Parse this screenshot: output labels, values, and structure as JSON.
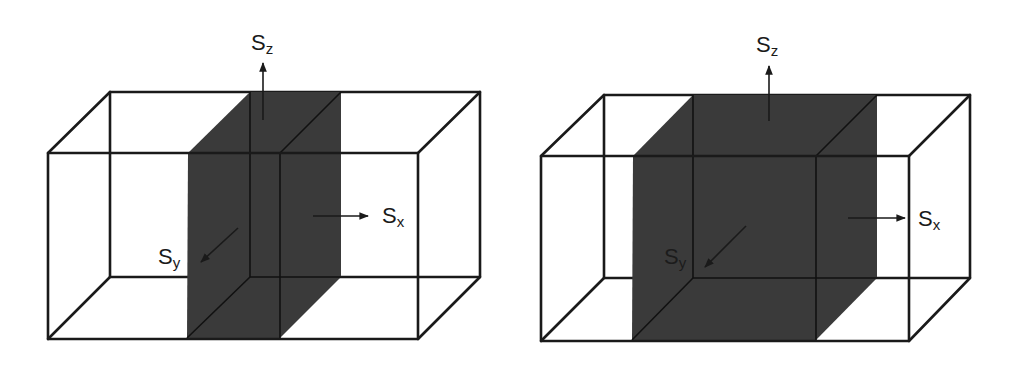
{
  "diagram": {
    "colors": {
      "edge": "#1a1a1a",
      "slab_fill": "#3a3a3a",
      "background": "#ffffff"
    },
    "panels": [
      {
        "name": "narrow-slab-box",
        "labels": {
          "sz": {
            "main": "S",
            "sub": "z"
          },
          "sx": {
            "main": "S",
            "sub": "x"
          },
          "sy": {
            "main": "S",
            "sub": "y"
          }
        }
      },
      {
        "name": "wide-slab-box",
        "labels": {
          "sz": {
            "main": "S",
            "sub": "z"
          },
          "sx": {
            "main": "S",
            "sub": "x"
          },
          "sy": {
            "main": "S",
            "sub": "y"
          }
        }
      }
    ]
  }
}
